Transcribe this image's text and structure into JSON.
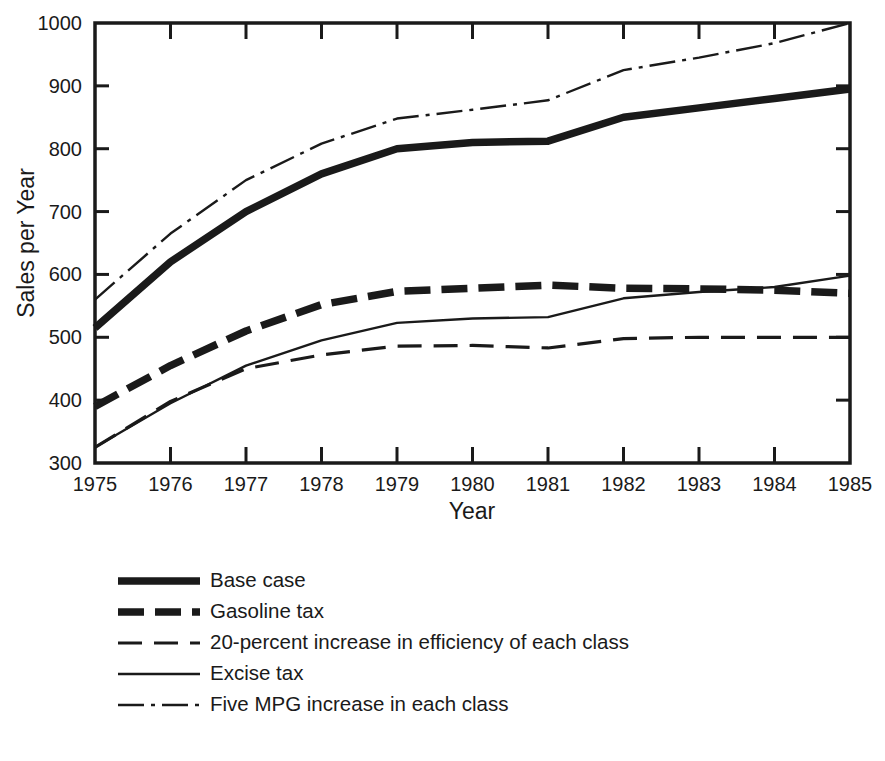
{
  "chart_data": {
    "type": "line",
    "title": "",
    "xlabel": "Year",
    "ylabel": "Sales per Year",
    "x": [
      1975,
      1976,
      1977,
      1978,
      1979,
      1980,
      1981,
      1982,
      1983,
      1984,
      1985
    ],
    "xticklabels": [
      "1975",
      "1976",
      "1977",
      "1978",
      "1979",
      "1980",
      "1981",
      "1982",
      "1983",
      "1984",
      "1985"
    ],
    "yticklabels": [
      "300",
      "400",
      "500",
      "600",
      "700",
      "800",
      "900",
      "1000"
    ],
    "yticks": [
      300,
      400,
      500,
      600,
      700,
      800,
      900,
      1000
    ],
    "xlim": [
      1975,
      1985
    ],
    "ylim": [
      300,
      1000
    ],
    "grid": false,
    "legend_position": "below-plot",
    "series": [
      {
        "name": "Base case",
        "style": "thick-solid",
        "values": [
          515,
          620,
          700,
          760,
          800,
          810,
          812,
          850,
          865,
          880,
          895
        ]
      },
      {
        "name": "Gasoline tax",
        "style": "thick-dashed",
        "values": [
          390,
          455,
          510,
          552,
          573,
          578,
          583,
          578,
          577,
          575,
          570
        ]
      },
      {
        "name": "20-percent increase in efficiency of each class",
        "style": "thin-dashed",
        "values": [
          325,
          398,
          450,
          472,
          486,
          487,
          483,
          498,
          500,
          500,
          500
        ]
      },
      {
        "name": "Excise tax",
        "style": "thin-solid",
        "values": [
          325,
          395,
          455,
          495,
          523,
          530,
          532,
          562,
          572,
          580,
          598
        ]
      },
      {
        "name": "Five MPG increase in each class",
        "style": "thin-dashdot",
        "values": [
          560,
          665,
          750,
          808,
          848,
          862,
          877,
          925,
          945,
          968,
          1000
        ]
      }
    ]
  },
  "legend": {
    "items": [
      {
        "label": "Base case",
        "style": "thick-solid"
      },
      {
        "label": "Gasoline tax",
        "style": "thick-dashed"
      },
      {
        "label": "20-percent increase in efficiency of each class",
        "style": "thin-dashed"
      },
      {
        "label": "Excise tax",
        "style": "thin-solid"
      },
      {
        "label": "Five MPG increase in each class",
        "style": "thin-dashdot"
      }
    ]
  },
  "colors": {
    "ink": "#1a1a1a",
    "background": "#ffffff"
  }
}
